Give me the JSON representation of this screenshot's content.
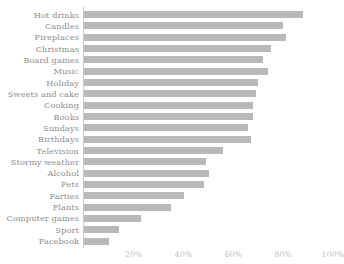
{
  "chart_data": {
    "type": "bar",
    "orientation": "horizontal",
    "title": "",
    "subtitle": "",
    "xlabel": "",
    "ylabel": "",
    "xlim": [
      0,
      100
    ],
    "grid": false,
    "legend": null,
    "xtick_labels": [
      "20%",
      "40%",
      "60%",
      "80%",
      "100%"
    ],
    "xtick_values": [
      20,
      40,
      60,
      80,
      100
    ],
    "unit": "%",
    "bar_color": "#b9b9b9",
    "label_color": "#8e8e8e",
    "tick_color": "#bcbcbc",
    "axis_color": "#c9c9c9",
    "categories": [
      "Hot drinks",
      "Candles",
      "Fireplaces",
      "Christmas",
      "Board games",
      "Music",
      "Holiday",
      "Sweets and cake",
      "Cooking",
      "Books",
      "Sundays",
      "Birthdays",
      "Television",
      "Stormy weather",
      "Alcohol",
      "Pets",
      "Parties",
      "Plants",
      "Computer games",
      "Sport",
      "Facebook"
    ],
    "values": [
      88,
      80,
      81,
      75,
      72,
      74,
      70,
      69,
      68,
      68,
      66,
      67,
      56,
      49,
      50,
      48,
      40,
      35,
      23,
      14,
      10
    ]
  }
}
